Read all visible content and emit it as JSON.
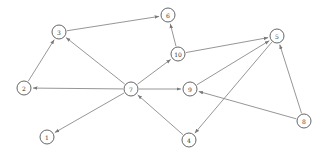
{
  "diagram": {
    "type": "directed-graph",
    "node_radius": 7,
    "colors": {
      "edge": "#8a8a8a",
      "node_stroke": "#555555",
      "node_fill": "#ffffff",
      "label": "#333333"
    },
    "nodes": [
      {
        "id": "1",
        "label": "1",
        "x": 47,
        "y": 137
      },
      {
        "id": "2",
        "label": "2",
        "x": 24,
        "y": 88
      },
      {
        "id": "3",
        "label": "3",
        "x": 59,
        "y": 32
      },
      {
        "id": "4",
        "label": "4",
        "x": 189,
        "y": 140
      },
      {
        "id": "5",
        "label": "5",
        "x": 277,
        "y": 36
      },
      {
        "id": "6",
        "label": "6",
        "x": 168,
        "y": 15
      },
      {
        "id": "7",
        "label": "7",
        "x": 131,
        "y": 89
      },
      {
        "id": "8",
        "label": "8",
        "x": 304,
        "y": 121
      },
      {
        "id": "9",
        "label": "9",
        "x": 190,
        "y": 89
      },
      {
        "id": "10",
        "label": "10",
        "x": 178,
        "y": 54
      }
    ],
    "edges": [
      {
        "from": "7",
        "to": "2"
      },
      {
        "from": "7",
        "to": "1"
      },
      {
        "from": "7",
        "to": "3"
      },
      {
        "from": "7",
        "to": "10"
      },
      {
        "from": "7",
        "to": "9"
      },
      {
        "from": "2",
        "to": "3"
      },
      {
        "from": "3",
        "to": "6"
      },
      {
        "from": "10",
        "to": "6"
      },
      {
        "from": "10",
        "to": "5"
      },
      {
        "from": "9",
        "to": "5"
      },
      {
        "from": "5",
        "to": "4"
      },
      {
        "from": "4",
        "to": "7"
      },
      {
        "from": "8",
        "to": "5"
      },
      {
        "from": "8",
        "to": "9"
      }
    ]
  }
}
